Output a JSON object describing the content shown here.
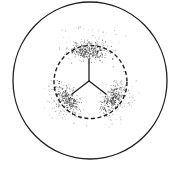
{
  "canvas": {
    "width": 178,
    "height": 177,
    "background": "#ffffff"
  },
  "colors": {
    "stroke": "#1f1f1f",
    "stipple": "#2a2a2a"
  },
  "outer_circle": {
    "cx": 90,
    "cy": 80.5,
    "rx": 77,
    "ry": 78.5,
    "stroke_width": 1.3
  },
  "inner_dashed_circle": {
    "cx": 90.5,
    "cy": 82,
    "r": 36.5,
    "stroke_width": 1.4,
    "dash": "4 2.6"
  },
  "y_suture": {
    "junction": {
      "x": 89,
      "y": 81
    },
    "arms": [
      {
        "name": "top",
        "x": 89,
        "y": 59
      },
      {
        "name": "lower-left",
        "x": 72,
        "y": 94
      },
      {
        "name": "lower-right",
        "x": 106,
        "y": 94
      }
    ],
    "stroke_width": 1.3
  },
  "stipple_zones": [
    {
      "name": "top",
      "core": {
        "cx": 89,
        "cy": 51,
        "rx": 20,
        "ry": 8,
        "count": 320,
        "angle": 0
      },
      "halo": {
        "cx": 89,
        "cy": 43,
        "rx": 26,
        "ry": 15,
        "count": 110,
        "angle": 0
      },
      "seed": 11
    },
    {
      "name": "lower-left",
      "core": {
        "cx": 66,
        "cy": 98,
        "rx": 9,
        "ry": 16,
        "count": 300,
        "angle": -35
      },
      "halo": {
        "cx": 60,
        "cy": 101,
        "rx": 14,
        "ry": 22,
        "count": 110,
        "angle": -35
      },
      "seed": 23
    },
    {
      "name": "lower-right",
      "core": {
        "cx": 113,
        "cy": 98,
        "rx": 9,
        "ry": 16,
        "count": 300,
        "angle": 35
      },
      "halo": {
        "cx": 119,
        "cy": 101,
        "rx": 14,
        "ry": 22,
        "count": 110,
        "angle": 35
      },
      "seed": 37
    }
  ]
}
